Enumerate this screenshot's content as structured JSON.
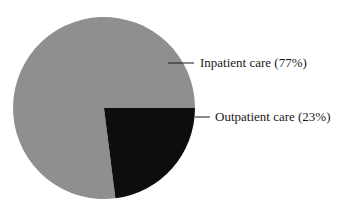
{
  "chart_data": {
    "type": "pie",
    "title": "",
    "slices": [
      {
        "label": "Inpatient care",
        "value": 77,
        "color": "#8f8f8f",
        "display": "Inpatient care (77%)"
      },
      {
        "label": "Outpatient care",
        "value": 23,
        "color": "#0d0d0d",
        "display": "Outpatient care (23%)"
      }
    ],
    "legend": "leader-line labels, right"
  }
}
